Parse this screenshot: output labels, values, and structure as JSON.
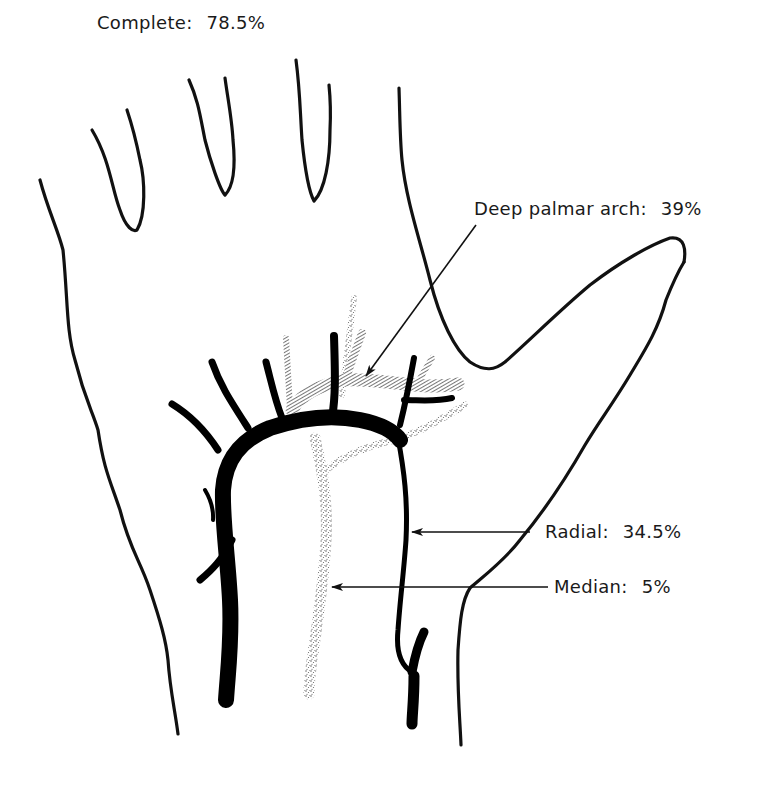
{
  "figure": {
    "colors": {
      "outline": "#111111",
      "superficial_arch": "#000000",
      "deep_arch_hatch": "#6e6e6e",
      "median_stipple": "#8a8a8a",
      "background": "#ffffff"
    },
    "labels": {
      "complete": {
        "name": "Complete:",
        "value": "78.5%"
      },
      "deep_palmar_arch": {
        "name": "Deep palmar arch:",
        "value": "39%"
      },
      "radial": {
        "name": "Radial:",
        "value": "34.5%"
      },
      "median": {
        "name": "Median:",
        "value": "5%"
      }
    }
  }
}
